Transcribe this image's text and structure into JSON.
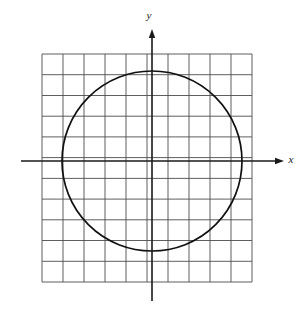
{
  "figure": {
    "kind": "cartesian-graph",
    "background_color": "#ffffff",
    "width": 308,
    "height": 317
  },
  "axes": {
    "x_axis": {
      "label": "x",
      "label_x": 291,
      "label_y": 163,
      "line_y": 161,
      "line_x_start": 21,
      "line_x_end": 276,
      "arrow_tip_x": 284,
      "color": "#1a1a1a",
      "stroke_width": 1.6
    },
    "y_axis": {
      "label": "y",
      "label_x": 149,
      "label_y": 19,
      "line_x": 152,
      "line_y_start": 37,
      "line_y_end": 301,
      "arrow_tip_y": 29,
      "color": "#1a1a1a",
      "stroke_width": 1.6
    }
  },
  "grid": {
    "color": "#4d4d4d",
    "stroke_width": 0.9,
    "x_start": 42,
    "x_end": 252,
    "y_start": 54,
    "y_end": 282,
    "cell_width": 21,
    "cell_height": 20.73,
    "vertical_line_count": 11,
    "horizontal_line_count": 12,
    "vertical_lines_x": [
      42,
      63,
      84,
      105,
      126,
      147,
      168,
      189,
      210,
      231,
      252
    ],
    "horizontal_lines_y": [
      54,
      74.7,
      95.5,
      116.2,
      136.9,
      157.6,
      178.4,
      199.1,
      219.8,
      240.5,
      261.3,
      282
    ]
  },
  "chart_data": {
    "type": "line",
    "title": "",
    "xlabel": "x",
    "ylabel": "y",
    "curve": "circle",
    "equation": "x^2 + y^2 = r^2",
    "center": {
      "x": 0,
      "y": 0
    },
    "center_px": {
      "x": 152,
      "y": 161
    },
    "radius_px": 90,
    "radius_cells_x": 4.29,
    "radius_cells_y": 4.34,
    "stroke_color": "#111111",
    "stroke_width": 1.7,
    "fill": "none",
    "grid": true,
    "legend": false,
    "intercepts_px": {
      "left": {
        "x": 62,
        "y": 161
      },
      "right": {
        "x": 242,
        "y": 161
      },
      "top": {
        "x": 152,
        "y": 71
      },
      "bottom": {
        "x": 152,
        "y": 251
      }
    }
  }
}
